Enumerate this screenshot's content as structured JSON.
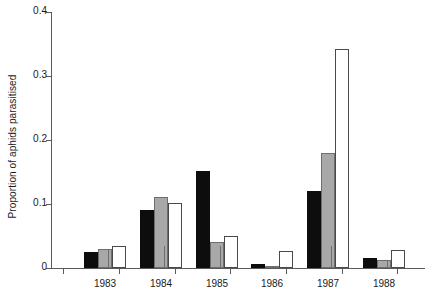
{
  "chart_data": {
    "type": "bar",
    "title": "",
    "xlabel": "",
    "ylabel": "Proportion of aphids parasitised",
    "categories": [
      "1983",
      "1984",
      "1985",
      "1986",
      "1987",
      "1988"
    ],
    "series": [
      {
        "name": "black",
        "color": "#0d0d0d",
        "values": [
          0.025,
          0.09,
          0.152,
          0.006,
          0.12,
          0.015
        ]
      },
      {
        "name": "gray",
        "color": "#a8a8a8",
        "values": [
          0.03,
          0.111,
          0.04,
          0.002,
          0.18,
          0.012
        ]
      },
      {
        "name": "white",
        "color": "#ffffff",
        "values": [
          0.035,
          0.101,
          0.05,
          0.027,
          0.342,
          0.028
        ]
      }
    ],
    "ylim": [
      0,
      0.4
    ],
    "yticks": [
      0,
      0.1,
      0.2,
      0.3,
      0.4
    ],
    "ytick_labels": [
      "0",
      "0.1",
      "0.2",
      "0.3",
      "0.4"
    ],
    "grid": false,
    "legend": "none"
  }
}
